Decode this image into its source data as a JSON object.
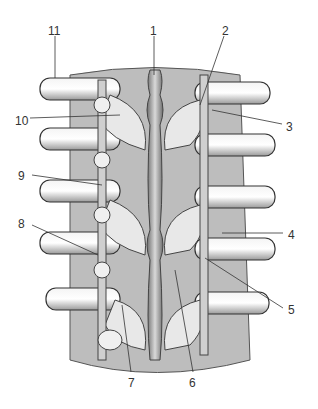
{
  "figure": {
    "labels": [
      {
        "n": "1",
        "x": 150,
        "y": 25
      },
      {
        "n": "2",
        "x": 222,
        "y": 25
      },
      {
        "n": "3",
        "x": 286,
        "y": 121
      },
      {
        "n": "4",
        "x": 288,
        "y": 229
      },
      {
        "n": "5",
        "x": 288,
        "y": 304
      },
      {
        "n": "6",
        "x": 189,
        "y": 377
      },
      {
        "n": "7",
        "x": 128,
        "y": 377
      },
      {
        "n": "8",
        "x": 18,
        "y": 218
      },
      {
        "n": "9",
        "x": 18,
        "y": 170
      },
      {
        "n": "10",
        "x": 15,
        "y": 115
      },
      {
        "n": "11",
        "x": 48,
        "y": 25
      }
    ]
  }
}
